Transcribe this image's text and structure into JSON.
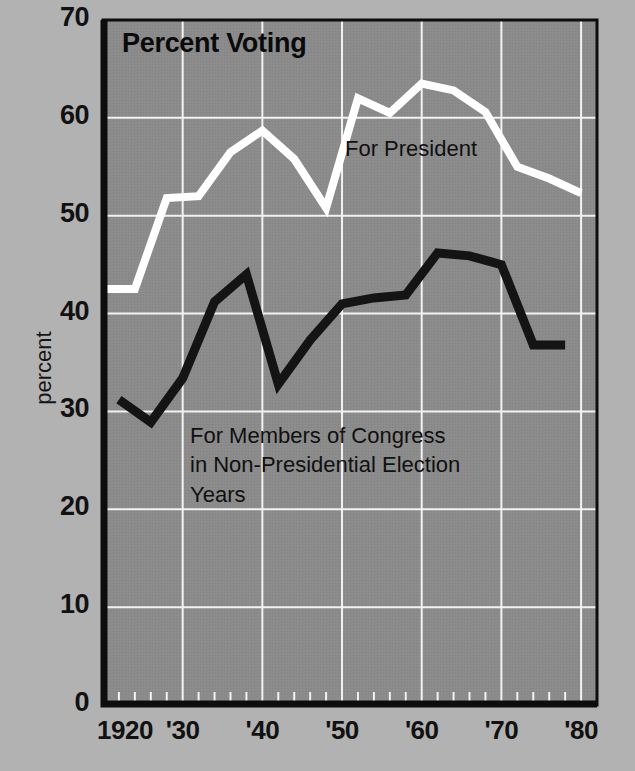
{
  "chart_data": {
    "type": "line",
    "title": "Percent Voting",
    "xlabel": "",
    "ylabel": "percent",
    "xlim": [
      1920,
      1982
    ],
    "ylim": [
      0,
      70
    ],
    "grid": true,
    "legend_position": "inline-annotations",
    "background_color": "#8a8a8a",
    "page_color": "#b2b2b2",
    "x_ticks": [
      "1920",
      "'30",
      "'40",
      "'50",
      "'60",
      "'70",
      "'80"
    ],
    "x_tick_values": [
      1920,
      1930,
      1940,
      1950,
      1960,
      1970,
      1980
    ],
    "y_ticks": [
      "0",
      "10",
      "20",
      "30",
      "40",
      "50",
      "60",
      "70"
    ],
    "y_tick_values": [
      0,
      10,
      20,
      30,
      40,
      50,
      60,
      70
    ],
    "minor_tick_interval_years": 2,
    "series": [
      {
        "name": "For President",
        "color": "#ffffff",
        "label_text": "For President",
        "x": [
          1920,
          1924,
          1928,
          1932,
          1936,
          1940,
          1944,
          1948,
          1952,
          1956,
          1960,
          1964,
          1968,
          1972,
          1976,
          1980
        ],
        "values": [
          42.5,
          42.5,
          51.8,
          52.0,
          56.5,
          58.7,
          55.8,
          50.8,
          62.0,
          60.5,
          63.5,
          62.8,
          60.6,
          55.0,
          53.8,
          52.3
        ]
      },
      {
        "name": "For Members of Congress in Non-Presidential Election Years",
        "color": "#141414",
        "label_text": "For Members of Congress\nin Non-Presidential Election\nYears",
        "x": [
          1922,
          1926,
          1930,
          1934,
          1938,
          1942,
          1946,
          1950,
          1954,
          1958,
          1962,
          1966,
          1970,
          1974,
          1978
        ],
        "values": [
          31.2,
          28.9,
          33.4,
          41.2,
          44.0,
          32.8,
          37.3,
          41.0,
          41.6,
          41.9,
          46.2,
          45.9,
          45.0,
          36.8,
          36.8
        ]
      }
    ]
  }
}
